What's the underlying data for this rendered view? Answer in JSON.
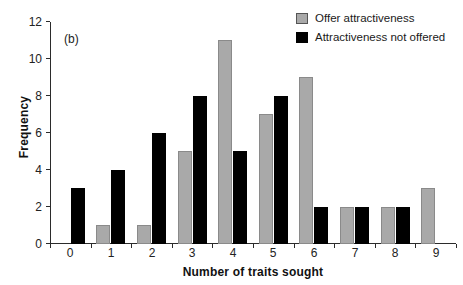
{
  "chart_data": {
    "type": "bar",
    "title": "",
    "panel_label": "(b)",
    "xlabel": "Number of traits sought",
    "ylabel": "Frequency",
    "categories": [
      "0",
      "1",
      "2",
      "3",
      "4",
      "5",
      "6",
      "7",
      "8",
      "9"
    ],
    "series": [
      {
        "name": "Offer attractiveness",
        "color": "#a9a9a9",
        "values": [
          0,
          1,
          1,
          5,
          11,
          7,
          9,
          2,
          2,
          3
        ]
      },
      {
        "name": "Attractiveness not offered",
        "color": "#000000",
        "values": [
          3,
          4,
          6,
          8,
          5,
          8,
          2,
          2,
          2,
          0
        ]
      }
    ],
    "ylim": [
      0,
      12
    ],
    "yticks": [
      0,
      2,
      4,
      6,
      8,
      10,
      12
    ],
    "ytick_labels": [
      "0",
      "2",
      "4",
      "6",
      "8",
      "10",
      "12"
    ],
    "grid": false,
    "legend_position": "top-right"
  }
}
